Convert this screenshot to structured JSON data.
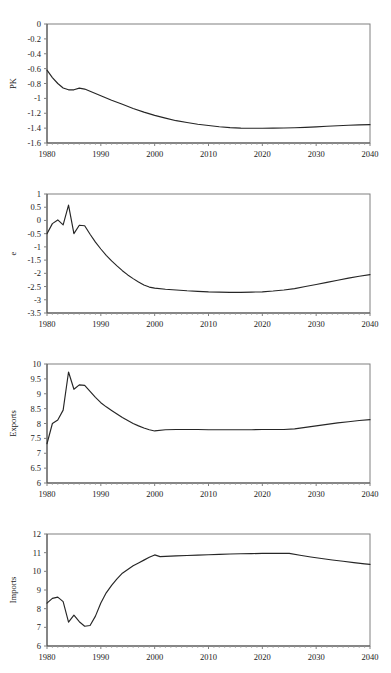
{
  "figure": {
    "background": "#ffffff",
    "line_color": "#262626",
    "frame_color": "#808080",
    "text_color": "#1a1a1a",
    "panel_count": 4
  },
  "chart_data": [
    {
      "type": "line",
      "title": "",
      "xlabel": "",
      "ylabel": "PK",
      "xlim": [
        1980,
        2040
      ],
      "ylim": [
        -1.6,
        0
      ],
      "xticks": [
        1980,
        1990,
        2000,
        2010,
        2020,
        2030,
        2040
      ],
      "xticklabels": [
        "1980",
        "1990",
        "2000",
        "2010",
        "2020",
        "2030",
        "2040"
      ],
      "yticks": [
        0,
        -0.2,
        -0.4,
        -0.6,
        -0.8,
        -1,
        -1.2,
        -1.4,
        -1.6
      ],
      "yticklabels": [
        "0",
        "-0.2",
        "-0.4",
        "-0.6",
        "-0.8",
        "-1",
        "-1.2",
        "-1.4",
        "-1.6"
      ],
      "grid": false,
      "legend": "none",
      "minor_xticks": true,
      "x": [
        1980,
        1981,
        1982,
        1983,
        1984,
        1985,
        1986,
        1987,
        1988,
        1989,
        1990,
        1992,
        1994,
        1996,
        1998,
        2000,
        2002,
        2004,
        2006,
        2008,
        2010,
        2012,
        2014,
        2016,
        2018,
        2020,
        2022,
        2024,
        2026,
        2028,
        2030,
        2032,
        2034,
        2036,
        2038,
        2040
      ],
      "y": [
        -0.62,
        -0.72,
        -0.8,
        -0.86,
        -0.885,
        -0.885,
        -0.862,
        -0.875,
        -0.905,
        -0.935,
        -0.965,
        -1.025,
        -1.08,
        -1.135,
        -1.185,
        -1.228,
        -1.265,
        -1.3,
        -1.325,
        -1.348,
        -1.365,
        -1.382,
        -1.393,
        -1.4,
        -1.402,
        -1.402,
        -1.4,
        -1.398,
        -1.395,
        -1.39,
        -1.383,
        -1.375,
        -1.368,
        -1.362,
        -1.357,
        -1.353
      ]
    },
    {
      "type": "line",
      "title": "",
      "xlabel": "",
      "ylabel": "e",
      "xlim": [
        1980,
        2040
      ],
      "ylim": [
        -3.5,
        1
      ],
      "xticks": [
        1980,
        1990,
        2000,
        2010,
        2020,
        2030,
        2040
      ],
      "xticklabels": [
        "1980",
        "1990",
        "2000",
        "2010",
        "2020",
        "2030",
        "2040"
      ],
      "yticks": [
        1,
        0.5,
        0,
        -0.5,
        -1,
        -1.5,
        -2,
        -2.5,
        -3,
        -3.5
      ],
      "yticklabels": [
        "1",
        "0.5",
        "0",
        "-0.5",
        "-1",
        "-1.5",
        "-2",
        "-2.5",
        "-3",
        "-3.5"
      ],
      "grid": false,
      "legend": "none",
      "minor_xticks": true,
      "x": [
        1980,
        1981,
        1982,
        1983,
        1984,
        1985,
        1986,
        1987,
        1988,
        1989,
        1990,
        1991,
        1992,
        1993,
        1994,
        1995,
        1996,
        1997,
        1998,
        1999,
        2000,
        2002,
        2004,
        2006,
        2008,
        2010,
        2012,
        2014,
        2016,
        2018,
        2020,
        2022,
        2024,
        2026,
        2028,
        2030,
        2032,
        2034,
        2036,
        2038,
        2040
      ],
      "y": [
        -0.5,
        -0.12,
        0.02,
        -0.17,
        0.58,
        -0.5,
        -0.18,
        -0.2,
        -0.52,
        -0.82,
        -1.08,
        -1.32,
        -1.53,
        -1.72,
        -1.9,
        -2.06,
        -2.2,
        -2.33,
        -2.44,
        -2.52,
        -2.56,
        -2.6,
        -2.63,
        -2.66,
        -2.68,
        -2.7,
        -2.71,
        -2.72,
        -2.72,
        -2.71,
        -2.7,
        -2.67,
        -2.63,
        -2.58,
        -2.5,
        -2.42,
        -2.34,
        -2.26,
        -2.18,
        -2.11,
        -2.05
      ]
    },
    {
      "type": "line",
      "title": "",
      "xlabel": "",
      "ylabel": "Exports",
      "xlim": [
        1980,
        2040
      ],
      "ylim": [
        6,
        10
      ],
      "xticks": [
        1980,
        1990,
        2000,
        2010,
        2020,
        2030,
        2040
      ],
      "xticklabels": [
        "1980",
        "1990",
        "2000",
        "2010",
        "2020",
        "2030",
        "2040"
      ],
      "yticks": [
        10,
        9.5,
        9,
        8.5,
        8,
        7.5,
        7,
        6.5,
        6
      ],
      "yticklabels": [
        "10",
        "9.5",
        "9",
        "8.5",
        "8",
        "7.5",
        "7",
        "6.5",
        "6"
      ],
      "grid": false,
      "legend": "none",
      "minor_xticks": true,
      "x": [
        1980,
        1981,
        1982,
        1983,
        1984,
        1985,
        1986,
        1987,
        1988,
        1989,
        1990,
        1991,
        1992,
        1993,
        1994,
        1995,
        1996,
        1997,
        1998,
        1999,
        2000,
        2002,
        2004,
        2006,
        2008,
        2010,
        2012,
        2014,
        2016,
        2018,
        2020,
        2022,
        2024,
        2026,
        2028,
        2030,
        2032,
        2034,
        2036,
        2038,
        2040
      ],
      "y": [
        7.32,
        8.0,
        8.12,
        8.45,
        9.73,
        9.15,
        9.3,
        9.28,
        9.08,
        8.88,
        8.7,
        8.56,
        8.44,
        8.32,
        8.2,
        8.1,
        8.0,
        7.92,
        7.85,
        7.79,
        7.75,
        7.79,
        7.8,
        7.8,
        7.8,
        7.79,
        7.79,
        7.79,
        7.79,
        7.79,
        7.8,
        7.8,
        7.8,
        7.82,
        7.87,
        7.92,
        7.97,
        8.02,
        8.06,
        8.1,
        8.13
      ]
    },
    {
      "type": "line",
      "title": "",
      "xlabel": "",
      "ylabel": "Imports",
      "xlim": [
        1980,
        2040
      ],
      "ylim": [
        6,
        12
      ],
      "xticks": [
        1980,
        1990,
        2000,
        2010,
        2020,
        2030,
        2040
      ],
      "xticklabels": [
        "1980",
        "1990",
        "2000",
        "2010",
        "2020",
        "2030",
        "2040"
      ],
      "yticks": [
        12,
        11,
        10,
        9,
        8,
        7,
        6
      ],
      "yticklabels": [
        "12",
        "11",
        "10",
        "9",
        "8",
        "7",
        "6"
      ],
      "grid": false,
      "legend": "none",
      "minor_xticks": true,
      "x": [
        1980,
        1981,
        1982,
        1983,
        1984,
        1985,
        1986,
        1987,
        1988,
        1989,
        1990,
        1991,
        1992,
        1993,
        1994,
        1995,
        1996,
        1997,
        1998,
        1999,
        2000,
        2001,
        2002,
        2004,
        2006,
        2008,
        2010,
        2012,
        2014,
        2016,
        2018,
        2020,
        2022,
        2024,
        2025,
        2027,
        2029,
        2031,
        2033,
        2035,
        2037,
        2039,
        2040
      ],
      "y": [
        8.3,
        8.55,
        8.62,
        8.38,
        7.28,
        7.65,
        7.3,
        7.06,
        7.1,
        7.6,
        8.3,
        8.85,
        9.25,
        9.6,
        9.9,
        10.1,
        10.3,
        10.45,
        10.6,
        10.75,
        10.88,
        10.79,
        10.8,
        10.83,
        10.85,
        10.87,
        10.89,
        10.91,
        10.93,
        10.94,
        10.95,
        10.96,
        10.96,
        10.96,
        10.96,
        10.86,
        10.77,
        10.69,
        10.61,
        10.54,
        10.47,
        10.4,
        10.37
      ]
    }
  ]
}
